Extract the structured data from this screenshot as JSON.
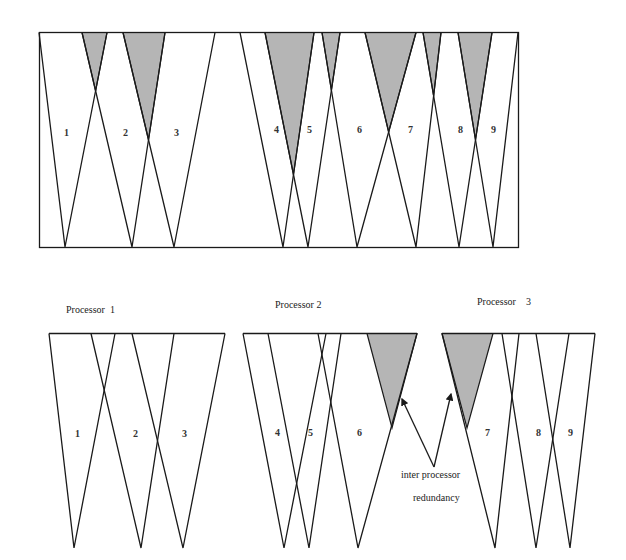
{
  "colors": {
    "line": "#1a1a1a",
    "shade": "#b5b5b5",
    "background": "#ffffff"
  },
  "top_diagram": {
    "region_labels": [
      "1",
      "2",
      "3",
      "4",
      "5",
      "6",
      "7",
      "8",
      "9"
    ],
    "shaded_overlaps": [
      "1-2",
      "2-3",
      "4-5",
      "5-6",
      "6-7",
      "7-8",
      "8-9"
    ]
  },
  "processors": [
    {
      "label": "Processor  1",
      "region_labels": [
        "1",
        "2",
        "3"
      ]
    },
    {
      "label": "Processor 2",
      "region_labels": [
        "4",
        "5",
        "6"
      ]
    },
    {
      "label": "Processor    3",
      "region_labels": [
        "7",
        "8",
        "9"
      ]
    }
  ],
  "annotation": {
    "line1": "inter processor",
    "line2": "redundancy"
  }
}
